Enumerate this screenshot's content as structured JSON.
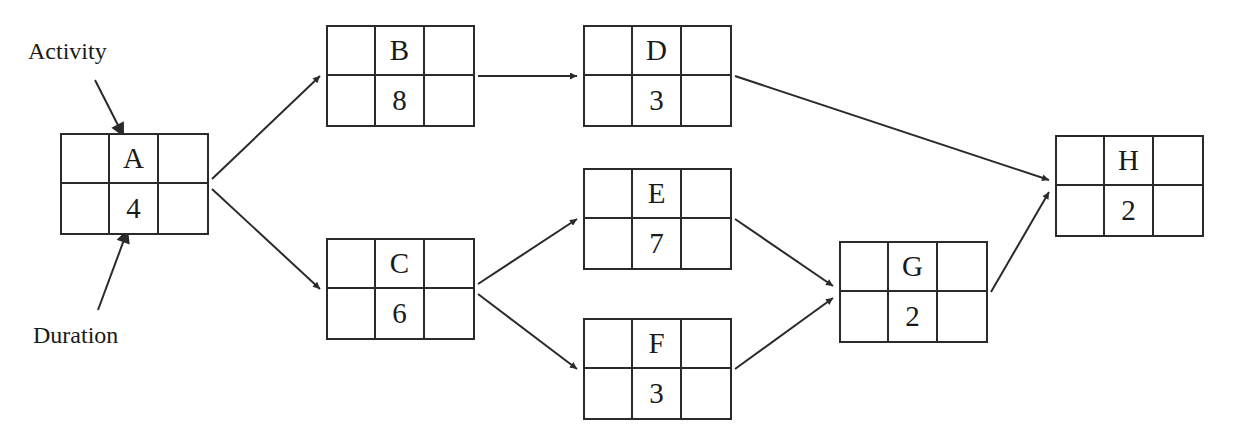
{
  "diagram": {
    "type": "activity-on-node network",
    "legend": {
      "activity_label": "Activity",
      "duration_label": "Duration"
    },
    "nodes": [
      {
        "id": "A",
        "activity": "A",
        "duration": "4",
        "x": 60,
        "y": 133
      },
      {
        "id": "B",
        "activity": "B",
        "duration": "8",
        "x": 326,
        "y": 25
      },
      {
        "id": "C",
        "activity": "C",
        "duration": "6",
        "x": 326,
        "y": 238
      },
      {
        "id": "D",
        "activity": "D",
        "duration": "3",
        "x": 583,
        "y": 25
      },
      {
        "id": "E",
        "activity": "E",
        "duration": "7",
        "x": 583,
        "y": 168
      },
      {
        "id": "F",
        "activity": "F",
        "duration": "3",
        "x": 583,
        "y": 318
      },
      {
        "id": "G",
        "activity": "G",
        "duration": "2",
        "x": 839,
        "y": 241
      },
      {
        "id": "H",
        "activity": "H",
        "duration": "2",
        "x": 1055,
        "y": 135
      }
    ],
    "edges": [
      {
        "from": "A",
        "to": "B"
      },
      {
        "from": "A",
        "to": "C"
      },
      {
        "from": "B",
        "to": "D"
      },
      {
        "from": "C",
        "to": "E"
      },
      {
        "from": "C",
        "to": "F"
      },
      {
        "from": "D",
        "to": "H"
      },
      {
        "from": "E",
        "to": "G"
      },
      {
        "from": "F",
        "to": "G"
      },
      {
        "from": "G",
        "to": "H"
      }
    ],
    "line_color": "#2a2a2a"
  }
}
